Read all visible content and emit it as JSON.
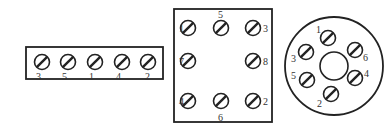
{
  "diagram": {
    "title": "",
    "colors": {
      "stroke": "#222222",
      "background": "#ffffff",
      "label": "#333333"
    },
    "terminal_strip": {
      "shape": "rectangle",
      "box": {
        "x": 26,
        "y": 47,
        "w": 137,
        "h": 32
      },
      "screws": [
        {
          "label": "3",
          "cx": 42,
          "cy": 62,
          "lx": 36,
          "ly": 80
        },
        {
          "label": "5",
          "cx": 68,
          "cy": 62,
          "lx": 62,
          "ly": 80
        },
        {
          "label": "1",
          "cx": 95,
          "cy": 62,
          "lx": 89,
          "ly": 80
        },
        {
          "label": "4",
          "cx": 122,
          "cy": 62,
          "lx": 116,
          "ly": 80
        },
        {
          "label": "2",
          "cx": 148,
          "cy": 62,
          "lx": 145,
          "ly": 80
        }
      ]
    },
    "square_socket": {
      "shape": "square",
      "box": {
        "x": 174,
        "y": 9,
        "w": 98,
        "h": 113
      },
      "screws": [
        {
          "label": "1",
          "cx": 188,
          "cy": 28,
          "lx": 179,
          "ly": 32
        },
        {
          "label": "5",
          "cx": 221,
          "cy": 28,
          "lx": 218,
          "ly": 18
        },
        {
          "label": "3",
          "cx": 253,
          "cy": 28,
          "lx": 263,
          "ly": 32
        },
        {
          "label": "7",
          "cx": 188,
          "cy": 61,
          "lx": 179,
          "ly": 65
        },
        {
          "label": "8",
          "cx": 253,
          "cy": 61,
          "lx": 263,
          "ly": 65
        },
        {
          "label": "4",
          "cx": 188,
          "cy": 101,
          "lx": 179,
          "ly": 105
        },
        {
          "label": "6",
          "cx": 221,
          "cy": 101,
          "lx": 218,
          "ly": 121
        },
        {
          "label": "2",
          "cx": 253,
          "cy": 101,
          "lx": 263,
          "ly": 105
        }
      ]
    },
    "round_socket": {
      "shape": "circle",
      "outer": {
        "cx": 334,
        "cy": 66,
        "r": 49
      },
      "inner": {
        "cx": 334,
        "cy": 66,
        "r": 14
      },
      "screws": [
        {
          "label": "1",
          "cx": 328,
          "cy": 38,
          "lx": 316,
          "ly": 33
        },
        {
          "label": "6",
          "cx": 355,
          "cy": 50,
          "lx": 363,
          "ly": 61
        },
        {
          "label": "3",
          "cx": 306,
          "cy": 52,
          "lx": 291,
          "ly": 62
        },
        {
          "label": "4",
          "cx": 355,
          "cy": 78,
          "lx": 364,
          "ly": 77
        },
        {
          "label": "5",
          "cx": 307,
          "cy": 80,
          "lx": 291,
          "ly": 79
        },
        {
          "label": "2",
          "cx": 331,
          "cy": 94,
          "lx": 317,
          "ly": 107
        }
      ]
    }
  }
}
